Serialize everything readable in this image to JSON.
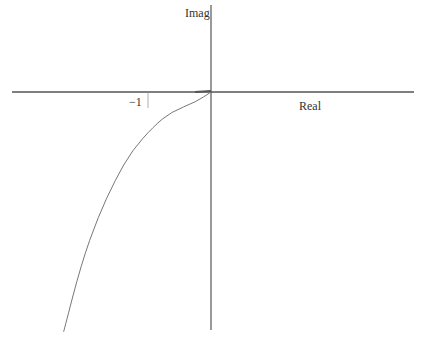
{
  "labels": {
    "imag": "Imag",
    "real": "Real",
    "tick_neg1": "−1"
  },
  "chart_data": {
    "type": "line",
    "title": "",
    "xlabel": "Real",
    "ylabel": "Imag",
    "grid": false,
    "x_ticks": [
      {
        "value": -1,
        "label": "−1"
      }
    ],
    "xlim": [
      -2.9,
      2.8
    ],
    "ylim": [
      -3.2,
      1.2
    ],
    "series": [
      {
        "name": "Nyquist locus",
        "x": [
          -2.34,
          -2.06,
          -1.79,
          -1.52,
          -1.25,
          -0.91,
          -0.64,
          -0.23,
          0.0
        ],
        "y": [
          -3.22,
          -2.31,
          -1.67,
          -1.18,
          -0.78,
          -0.46,
          -0.27,
          -0.13,
          0.0
        ]
      }
    ]
  },
  "style": {
    "axis_color": "#555555",
    "curve_color": "#777777",
    "background": "#ffffff"
  }
}
